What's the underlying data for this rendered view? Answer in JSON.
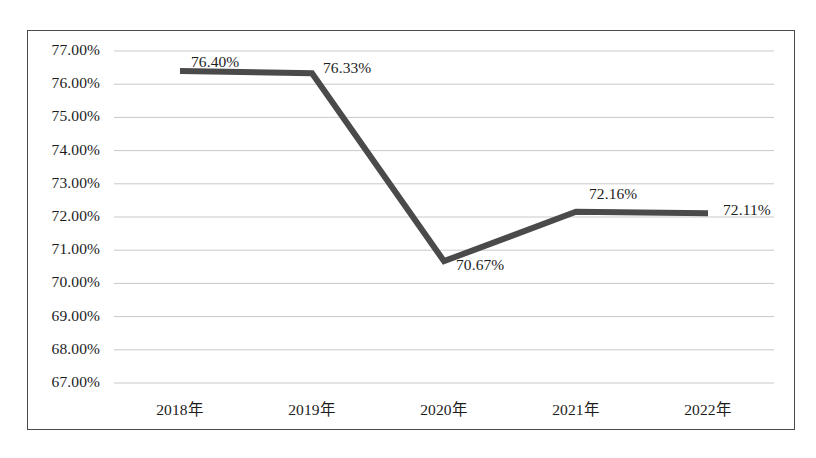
{
  "chart_data": {
    "type": "line",
    "title": "",
    "subtitle": "",
    "xlabel": "",
    "ylabel": "",
    "categories": [
      "2018年",
      "2019年",
      "2020年",
      "2021年",
      "2022年"
    ],
    "values": [
      76.4,
      76.33,
      70.67,
      72.16,
      72.11
    ],
    "value_labels": [
      "76.40%",
      "76.33%",
      "70.67%",
      "72.16%",
      "72.11%"
    ],
    "series": [
      {
        "name": "",
        "values": [
          76.4,
          76.33,
          70.67,
          72.16,
          72.11
        ]
      }
    ],
    "ylim": [
      67.0,
      77.0
    ],
    "ytick_step": 1.0,
    "ytick_labels": [
      "77.00%",
      "76.00%",
      "75.00%",
      "74.00%",
      "73.00%",
      "72.00%",
      "71.00%",
      "70.00%",
      "69.00%",
      "68.00%",
      "67.00%"
    ],
    "ytick_values": [
      77,
      76,
      75,
      74,
      73,
      72,
      71,
      70,
      69,
      68,
      67
    ],
    "grid": true,
    "grid_orientation": "horizontal",
    "legend": false,
    "legend_position": "none",
    "markers": false,
    "annotations": []
  },
  "style": {
    "line_color": "#4a4a4a",
    "grid_color": "#c9c9c9",
    "border_color": "#4a4a4a",
    "text_color": "#1c1c1c",
    "plot_background": "#ffffff",
    "line_width_px": 6
  },
  "label_offsets": {
    "positions": [
      {
        "x": 190,
        "y": 52,
        "align": "left"
      },
      {
        "x": 322,
        "y": 58,
        "align": "left"
      },
      {
        "x": 455,
        "y": 255,
        "align": "left"
      },
      {
        "x": 588,
        "y": 184,
        "align": "left"
      },
      {
        "x": 722,
        "y": 200,
        "align": "left"
      }
    ]
  }
}
